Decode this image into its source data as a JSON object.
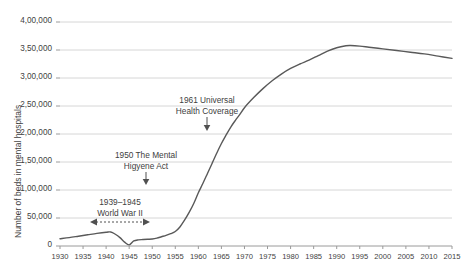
{
  "chart_data": {
    "type": "line",
    "title": "",
    "xlabel": "",
    "ylabel": "Number of beds in mental hospitals",
    "xlim": [
      1930,
      2015
    ],
    "ylim": [
      0,
      400000
    ],
    "grid": true,
    "legend": "none",
    "ytick_labels": [
      "4,00,000",
      "3,50,000",
      "3,00,000",
      "2,50,000",
      "2,00,000",
      "1,50,000",
      "1,00,000",
      "50,000",
      "0"
    ],
    "ytick_values": [
      400000,
      350000,
      300000,
      250000,
      200000,
      150000,
      100000,
      50000,
      0
    ],
    "xtick_labels": [
      "1930",
      "1935",
      "1940",
      "1945",
      "1950",
      "1955",
      "1960",
      "1965",
      "1970",
      "1975",
      "1980",
      "1985",
      "1990",
      "1995",
      "2000",
      "2005",
      "2010",
      "2015"
    ],
    "xtick_values": [
      1930,
      1935,
      1940,
      1945,
      1950,
      1955,
      1960,
      1965,
      1970,
      1975,
      1980,
      1985,
      1990,
      1995,
      2000,
      2005,
      2010,
      2015
    ],
    "series": [
      {
        "name": "Number of beds in mental hospitals",
        "color": "#595959",
        "x": [
          1930,
          1932,
          1934,
          1936,
          1938,
          1940,
          1941,
          1942,
          1943,
          1944,
          1945,
          1946,
          1947,
          1948,
          1949,
          1950,
          1951,
          1952,
          1953,
          1954,
          1955,
          1956,
          1957,
          1958,
          1959,
          1960,
          1961,
          1962,
          1963,
          1964,
          1965,
          1966,
          1967,
          1968,
          1969,
          1970,
          1972,
          1974,
          1976,
          1978,
          1980,
          1982,
          1984,
          1986,
          1988,
          1990,
          1992,
          1993,
          1995,
          1997,
          2000,
          2003,
          2006,
          2009,
          2012,
          2015
        ],
        "values": [
          13000,
          15000,
          17500,
          20000,
          22500,
          24500,
          25000,
          21000,
          15000,
          7000,
          2000,
          9000,
          11000,
          11500,
          12000,
          12500,
          14000,
          16500,
          19000,
          22000,
          26000,
          34000,
          46000,
          60000,
          76000,
          95000,
          112000,
          130000,
          148000,
          166000,
          183000,
          198000,
          212000,
          224000,
          235000,
          247000,
          265000,
          281000,
          295000,
          307000,
          317000,
          325000,
          332000,
          340000,
          348000,
          354000,
          357500,
          358000,
          357000,
          355000,
          352000,
          349000,
          346000,
          343000,
          339000,
          335000
        ]
      }
    ],
    "annotations": [
      {
        "name": "universal-health-coverage",
        "line1": "1961 Universal",
        "line2": "Health Coverage",
        "arrow": "down"
      },
      {
        "name": "mental-higyene-act",
        "line1": "1950 The Mental",
        "line2": "Higyene Act",
        "arrow": "down"
      },
      {
        "name": "world-war-two",
        "line1": "1939–1945",
        "line2": "World War II",
        "arrow": "double-dashed-horizontal"
      }
    ]
  }
}
